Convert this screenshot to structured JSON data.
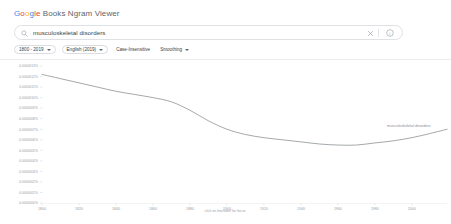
{
  "header": {
    "brand_parts": [
      "G",
      "o",
      "o",
      "g",
      "l",
      "e"
    ],
    "product_name": " Books Ngram Viewer",
    "colors": {
      "blue": "#4285F4",
      "red": "#EA4335",
      "yellow": "#FBBC05",
      "green": "#34A853"
    }
  },
  "search": {
    "value": "musculoskeletal disorders",
    "placeholder": "Search in Google Books Ngram Viewer",
    "search_icon": "search-icon",
    "clear_icon": "close-icon",
    "help_icon": "help-circle-icon"
  },
  "controls": [
    {
      "label": "1800 - 2019",
      "has_caret": true,
      "name": "year-range-select"
    },
    {
      "label": "English (2019)",
      "has_caret": true,
      "name": "corpus-select"
    },
    {
      "label": "Case-Insensitive",
      "has_caret": false,
      "name": "case-insensitive-toggle"
    },
    {
      "label": "Smoothing",
      "has_caret": true,
      "name": "smoothing-select"
    }
  ],
  "chart_data": {
    "type": "line",
    "title": "",
    "xlabel": "click on line/label for focus",
    "ylabel": "",
    "grid": true,
    "legend_position": "right-inline",
    "xlim": [
      1800,
      2019
    ],
    "ylim": [
      0.0,
      1.3e-06
    ],
    "x_ticks": [
      1800,
      1820,
      1840,
      1860,
      1880,
      1900,
      1920,
      1940,
      1960,
      1980,
      2000
    ],
    "x_tick_labels": [
      "1800",
      "1820",
      "1840",
      "1860",
      "1880",
      "1900",
      "1920",
      "1940",
      "1960",
      "1980",
      "2000"
    ],
    "y_ticks": [
      1.3e-06,
      1.2e-06,
      1.1e-06,
      1e-06,
      9e-07,
      8e-07,
      7e-07,
      6e-07,
      5e-07,
      4e-07,
      3e-07,
      2e-07,
      1e-07,
      0.0
    ],
    "y_tick_labels": [
      "0.0000013%",
      "0.0000012%",
      "0.0000011%",
      "0.0000010%",
      "0.0000009%",
      "0.0000008%",
      "0.0000007%",
      "0.0000006%",
      "0.0000005%",
      "0.0000004%",
      "0.0000003%",
      "0.0000002%",
      "0.0000001%",
      "0.0000000%"
    ],
    "series": [
      {
        "name": "musculoskeletal disorders",
        "color": "#7d8287",
        "label_text": "musculoskeletal disorders",
        "x": [
          1800,
          1810,
          1820,
          1830,
          1840,
          1850,
          1860,
          1870,
          1880,
          1890,
          1900,
          1910,
          1920,
          1930,
          1940,
          1950,
          1960,
          1970,
          1980,
          1990,
          2000,
          2010,
          2019
        ],
        "values": [
          1.22e-06,
          1.18e-06,
          1.14e-06,
          1.1e-06,
          1.06e-06,
          1.03e-06,
          1e-06,
          9.6e-07,
          8.8e-07,
          7.8e-07,
          7e-07,
          6.5e-07,
          6.2e-07,
          6e-07,
          5.8e-07,
          5.6e-07,
          5.5e-07,
          5.5e-07,
          5.7e-07,
          5.9e-07,
          6.2e-07,
          6.6e-07,
          7e-07
        ]
      }
    ]
  }
}
